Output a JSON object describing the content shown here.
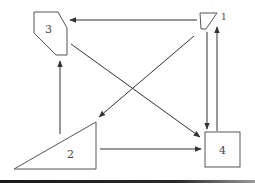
{
  "diagram": {
    "type": "directed-graph",
    "nodes": [
      {
        "id": "1",
        "label": "1",
        "shape": "trapezoid"
      },
      {
        "id": "2",
        "label": "2",
        "shape": "right-triangle"
      },
      {
        "id": "3",
        "label": "3",
        "shape": "pentagon"
      },
      {
        "id": "4",
        "label": "4",
        "shape": "square"
      }
    ],
    "edges": [
      {
        "from": "1",
        "to": "3"
      },
      {
        "from": "1",
        "to": "2"
      },
      {
        "from": "1",
        "to": "4"
      },
      {
        "from": "4",
        "to": "1"
      },
      {
        "from": "3",
        "to": "4"
      },
      {
        "from": "2",
        "to": "3"
      },
      {
        "from": "2",
        "to": "4"
      }
    ]
  }
}
